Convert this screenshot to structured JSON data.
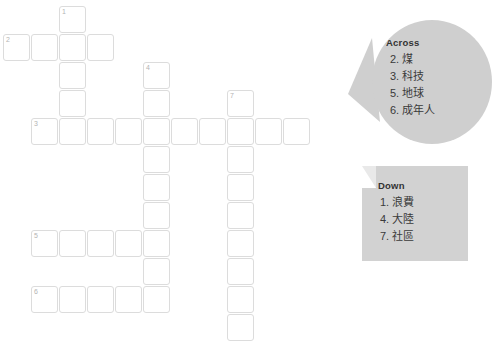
{
  "puzzle": {
    "type": "crossword",
    "cell_size": 25,
    "cell_pitch": 28,
    "grid_entries": [
      {
        "name": "entry-1-down",
        "number": "1",
        "direction": "down",
        "length": 5,
        "start_col": 2,
        "start_row": 0
      },
      {
        "name": "entry-2-across",
        "number": "2",
        "direction": "across",
        "length": 4,
        "start_col": 0,
        "start_row": 1
      },
      {
        "name": "entry-3-across",
        "number": "3",
        "direction": "across",
        "length": 10,
        "start_col": 1,
        "start_row": 4
      },
      {
        "name": "entry-4-down",
        "number": "4",
        "direction": "down",
        "length": 9,
        "start_col": 5,
        "start_row": 2
      },
      {
        "name": "entry-5-across",
        "number": "5",
        "direction": "across",
        "length": 5,
        "start_col": 1,
        "start_row": 8
      },
      {
        "name": "entry-6-across",
        "number": "6",
        "direction": "across",
        "length": 5,
        "start_col": 1,
        "start_row": 10
      },
      {
        "name": "entry-7-down",
        "number": "7",
        "direction": "down",
        "length": 9,
        "start_col": 8,
        "start_row": 3
      }
    ]
  },
  "across": {
    "heading": "Across",
    "clues": [
      {
        "number": "2.",
        "word": "煤"
      },
      {
        "number": "3.",
        "word": "科技"
      },
      {
        "number": "5.",
        "word": "地球"
      },
      {
        "number": "6.",
        "word": "成年人"
      }
    ]
  },
  "down": {
    "heading": "Down",
    "clues": [
      {
        "number": "1.",
        "word": "浪費"
      },
      {
        "number": "4.",
        "word": "大陸"
      },
      {
        "number": "7.",
        "word": "社區"
      }
    ]
  },
  "colors": {
    "page_background": "#ffffff",
    "cell_border": "#dcdcdc",
    "cell_fill": "#ffffff",
    "cell_number": "#b4b4b4",
    "bubble_fill": "#cfcfcf",
    "note_fill": "#d2d2d2",
    "text": "#3a3a3a",
    "heading": "#333333"
  }
}
